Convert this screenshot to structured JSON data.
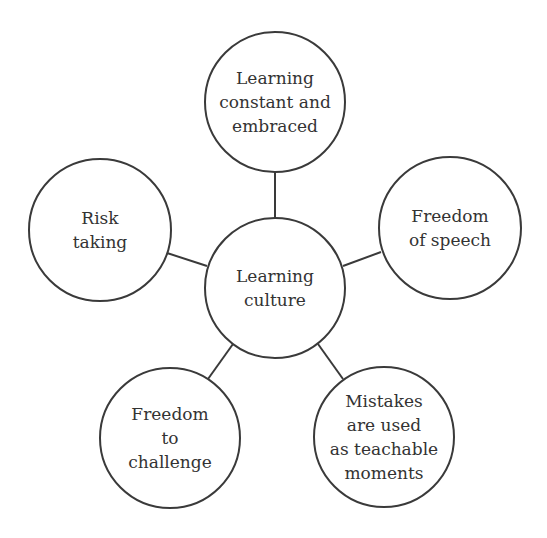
{
  "diagram": {
    "type": "hub-and-spoke concept map",
    "colors": {
      "stroke": "#3a3a3a",
      "text": "#333333",
      "fill": "#ffffff",
      "background": "#ffffff"
    },
    "center": {
      "id": "center",
      "label": "Learning\nculture",
      "cx": 275,
      "cy": 288,
      "r": 70
    },
    "nodes": [
      {
        "id": "top",
        "label": "Learning\nconstant and\nembraced",
        "cx": 275,
        "cy": 102,
        "r": 70
      },
      {
        "id": "right",
        "label": "Freedom\nof speech",
        "cx": 450,
        "cy": 228,
        "r": 71
      },
      {
        "id": "bottom-right",
        "label": "Mistakes\nare used\nas teachable\nmoments",
        "cx": 384,
        "cy": 437,
        "r": 70
      },
      {
        "id": "bottom-left",
        "label": "Freedom\nto\nchallenge",
        "cx": 170,
        "cy": 438,
        "r": 70
      },
      {
        "id": "left",
        "label": "Risk\ntaking",
        "cx": 100,
        "cy": 230,
        "r": 71
      }
    ],
    "edges": [
      {
        "from": "center",
        "to": "top"
      },
      {
        "from": "center",
        "to": "right"
      },
      {
        "from": "center",
        "to": "bottom-right"
      },
      {
        "from": "center",
        "to": "bottom-left"
      },
      {
        "from": "center",
        "to": "left"
      }
    ]
  }
}
